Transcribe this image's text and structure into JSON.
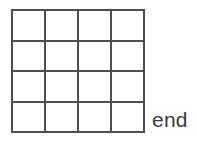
{
  "diagram": {
    "type": "grid",
    "title": "",
    "background_color": "#ffffff",
    "grid": {
      "rows": 4,
      "columns": 4,
      "cell_count": 16,
      "line_color": "#4f4f4f",
      "line_width_px": 2,
      "cell_fill": "#ffffff",
      "cells": [
        {
          "row": 1,
          "col": 1,
          "label": ""
        },
        {
          "row": 1,
          "col": 2,
          "label": ""
        },
        {
          "row": 1,
          "col": 3,
          "label": ""
        },
        {
          "row": 1,
          "col": 4,
          "label": ""
        },
        {
          "row": 2,
          "col": 1,
          "label": ""
        },
        {
          "row": 2,
          "col": 2,
          "label": ""
        },
        {
          "row": 2,
          "col": 3,
          "label": ""
        },
        {
          "row": 2,
          "col": 4,
          "label": ""
        },
        {
          "row": 3,
          "col": 1,
          "label": ""
        },
        {
          "row": 3,
          "col": 2,
          "label": ""
        },
        {
          "row": 3,
          "col": 3,
          "label": ""
        },
        {
          "row": 3,
          "col": 4,
          "label": ""
        },
        {
          "row": 4,
          "col": 1,
          "label": ""
        },
        {
          "row": 4,
          "col": 2,
          "label": ""
        },
        {
          "row": 4,
          "col": 3,
          "label": ""
        },
        {
          "row": 4,
          "col": 4,
          "label": ""
        }
      ]
    },
    "annotations": [
      {
        "id": "end",
        "text": "end",
        "color": "#3a3a3a",
        "position": "right-of-bottom-row"
      }
    ]
  }
}
